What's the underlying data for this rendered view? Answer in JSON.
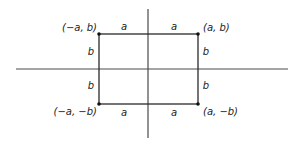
{
  "diagram": {
    "colors": {
      "line": "#2a2a2a",
      "axis": "#4a4a4a",
      "text": "#222222",
      "background": "#ffffff"
    },
    "axes": {
      "horizontal": {
        "x1": 16,
        "y": 69,
        "x2": 288
      },
      "vertical": {
        "x": 148,
        "y1": 9,
        "y2": 138
      }
    },
    "rectangle": {
      "left": 99,
      "top": 34,
      "right": 198,
      "bottom": 104
    },
    "corners": [
      {
        "id": "top-left",
        "label": "(−a, b)",
        "x": 99,
        "y": 34
      },
      {
        "id": "top-right",
        "label": "(a, b)",
        "x": 198,
        "y": 34
      },
      {
        "id": "bottom-left",
        "label": "(−a, −b)",
        "x": 99,
        "y": 104
      },
      {
        "id": "bottom-right",
        "label": "(a, −b)",
        "x": 198,
        "y": 104
      }
    ],
    "segment_labels": {
      "top_left_a": "a",
      "top_right_a": "a",
      "bottom_left_a": "a",
      "bottom_right_a": "a",
      "left_upper_b": "b",
      "left_lower_b": "b",
      "right_upper_b": "b",
      "right_lower_b": "b"
    }
  }
}
